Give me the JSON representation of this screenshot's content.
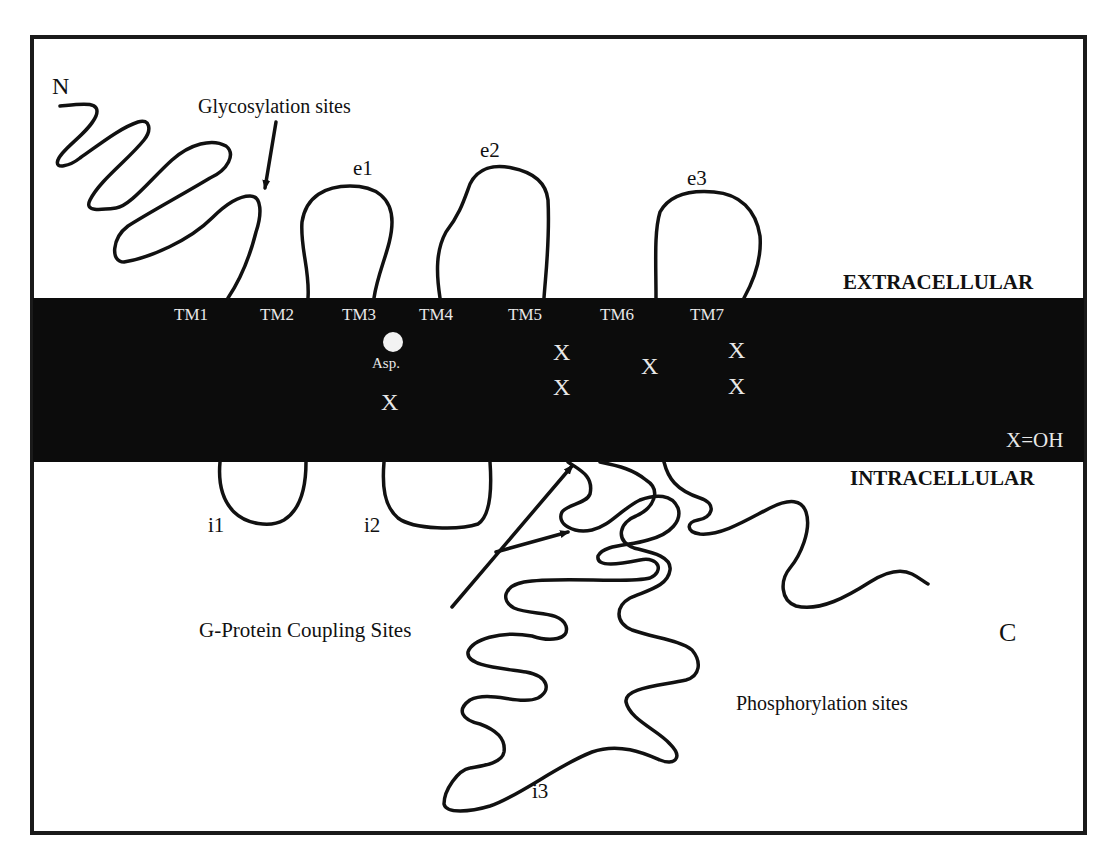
{
  "diagram": {
    "regions": {
      "extracellular": "EXTRACELLULAR",
      "intracellular": "INTRACELLULAR"
    },
    "termini": {
      "n": "N",
      "c": "C"
    },
    "extracellular_loops": [
      "e1",
      "e2",
      "e3"
    ],
    "intracellular_loops": [
      "i1",
      "i2",
      "i3"
    ],
    "transmembrane_helices": [
      "TM1",
      "TM2",
      "TM3",
      "TM4",
      "TM5",
      "TM6",
      "TM7"
    ],
    "markers": {
      "asp_label": "Asp.",
      "hydroxyl_symbol": "X",
      "legend": "X=OH"
    },
    "annotations": {
      "glycosylation": "Glycosylation sites",
      "g_protein": "G-Protein Coupling Sites",
      "phosphorylation": "Phosphorylation sites"
    },
    "colors": {
      "membrane": "#0c0c0c",
      "line": "#111111",
      "background": "#ffffff",
      "membrane_text": "#e8e8e8"
    }
  }
}
